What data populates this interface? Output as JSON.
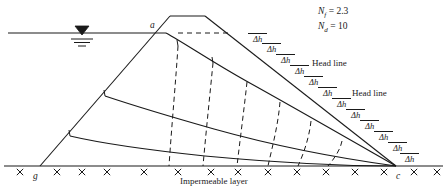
{
  "figure": {
    "type": "engineering-diagram",
    "background_color": "#ffffff",
    "line_color": "#1a1a1a"
  },
  "annotations": {
    "nf_label": "N",
    "nf_sub": "f",
    "nf_eq": " = 2.3",
    "nd_label": "N",
    "nd_sub": "d",
    "nd_eq": " = 10",
    "nf_value": 2.3,
    "nd_value": 10,
    "head_line_1": "Head line",
    "head_line_2": "Head line",
    "impermeable_layer": "Impermeable layer",
    "delta_h": "Δh"
  },
  "points": [
    {
      "id": "a",
      "label": "a",
      "x": 150,
      "y": 20
    },
    {
      "id": "g",
      "label": "g",
      "x": 33,
      "y": 171
    },
    {
      "id": "c",
      "label": "c",
      "x": 396,
      "y": 171
    }
  ],
  "drop_labels": [
    {
      "label": "Δh",
      "x": 248,
      "y": 33
    },
    {
      "label": "Δh",
      "x": 262,
      "y": 43
    },
    {
      "label": "Δh",
      "x": 276,
      "y": 54
    },
    {
      "label": "Δh",
      "x": 290,
      "y": 65
    },
    {
      "label": "Δh",
      "x": 304,
      "y": 76
    },
    {
      "label": "Δh",
      "x": 318,
      "y": 87
    },
    {
      "label": "Δh",
      "x": 332,
      "y": 98
    },
    {
      "label": "Δh",
      "x": 346,
      "y": 109
    },
    {
      "label": "Δh",
      "x": 360,
      "y": 120
    },
    {
      "label": "Δh",
      "x": 374,
      "y": 131
    },
    {
      "label": "Δh",
      "x": 388,
      "y": 142
    },
    {
      "label": "Δh",
      "x": 400,
      "y": 153
    }
  ],
  "head_lines": [
    {
      "text": "Head line",
      "x": 312,
      "y": 62
    },
    {
      "text": "Head line",
      "x": 352,
      "y": 92
    }
  ],
  "geometry": {
    "base_y": 166,
    "water_level_y": 33,
    "water_line_x_start": 8,
    "water_line_x_end": 166,
    "crest_left_x": 170,
    "crest_right_x": 205,
    "crest_y": 16,
    "toe_left_x": 40,
    "toe_right_x": 396,
    "hatch_count": 14
  }
}
